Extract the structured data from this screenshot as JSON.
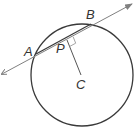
{
  "diagram": {
    "type": "geometry",
    "colors": {
      "circle": "#3a3a3a",
      "line": "#808080",
      "chord": "#3a3a3a",
      "segment": "#555555",
      "right_angle_mark": "#999999",
      "labels": "#333333"
    },
    "labels": {
      "A": "A",
      "B": "B",
      "P": "P",
      "C": "C"
    },
    "points": {
      "A": {
        "x": 36,
        "y": 54
      },
      "B": {
        "x": 91,
        "y": 24
      },
      "P": {
        "x": 67,
        "y": 40
      },
      "C": {
        "x": 82,
        "y": 75
      }
    },
    "circle": {
      "cx": 82,
      "cy": 75,
      "r": 51
    },
    "line": {
      "x1": 2,
      "y1": 74,
      "x2": 132,
      "y2": 4
    }
  }
}
